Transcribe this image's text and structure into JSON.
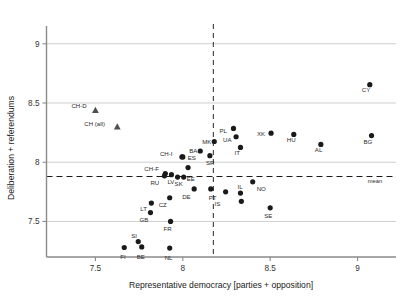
{
  "chart_data": {
    "type": "scatter",
    "title": "",
    "xlabel": "Representative democracy [parties + opposition]",
    "ylabel": "Deliberation + referendums",
    "xlim": [
      7.22,
      9.22
    ],
    "ylim": [
      7.2,
      9.15
    ],
    "xticks": [
      "7.5",
      "8",
      "8.5",
      "9"
    ],
    "xtick_values": [
      7.5,
      8.0,
      8.5,
      9.0
    ],
    "yticks": [
      "7.5",
      "8",
      "8.5",
      "9"
    ],
    "ytick_values": [
      7.5,
      8.0,
      8.5,
      9.0
    ],
    "grid": "horizontal",
    "legend": "none",
    "annotations": [
      {
        "text": "mean",
        "x": 9.1,
        "y": 7.88,
        "name": "mean-label"
      }
    ],
    "reference_lines": [
      {
        "orientation": "horizontal",
        "value": 7.88,
        "style": "dashed",
        "label": "mean"
      },
      {
        "orientation": "vertical",
        "value": 8.175,
        "style": "dashed",
        "label": ""
      }
    ],
    "series": [
      {
        "name": "countries",
        "marker": "circle",
        "points": [
          {
            "label": "CY",
            "x": 9.07,
            "y": 8.655,
            "lx": -8,
            "ly": 7
          },
          {
            "label": "BG",
            "x": 9.08,
            "y": 8.225,
            "lx": -8,
            "ly": 8
          },
          {
            "label": "AL",
            "x": 8.79,
            "y": 8.15,
            "lx": -6,
            "ly": 8
          },
          {
            "label": "HU",
            "x": 8.635,
            "y": 8.235,
            "lx": -7,
            "ly": 8
          },
          {
            "label": "XK",
            "x": 8.505,
            "y": 8.245,
            "lx": -14,
            "ly": 3
          },
          {
            "label": "PL",
            "x": 8.29,
            "y": 8.285,
            "lx": -14,
            "ly": 5
          },
          {
            "label": "UA",
            "x": 8.305,
            "y": 8.215,
            "lx": -13,
            "ly": 5
          },
          {
            "label": "IT",
            "x": 8.33,
            "y": 8.125,
            "lx": -6,
            "ly": 8
          },
          {
            "label": "MK",
            "x": 8.18,
            "y": 8.175,
            "lx": -12,
            "ly": 2
          },
          {
            "label": "BA",
            "x": 8.1,
            "y": 8.095,
            "lx": -11,
            "ly": 2
          },
          {
            "label": "SR",
            "x": 8.155,
            "y": 8.055,
            "lx": -4,
            "ly": 9
          },
          {
            "label": "ES",
            "x": 8.0,
            "y": 8.045,
            "lx": 5,
            "ly": 3
          },
          {
            "label": "CH-I",
            "x": 7.995,
            "y": 8.045,
            "lx": -22,
            "ly": -1
          },
          {
            "label": "SI2",
            "x": 8.03,
            "y": 7.955,
            "lx": 3,
            "ly": 3
          },
          {
            "label": "CH-F",
            "x": 7.9,
            "y": 7.905,
            "lx": -21,
            "ly": -2
          },
          {
            "label": "RU",
            "x": 7.895,
            "y": 7.885,
            "lx": -14,
            "ly": 9
          },
          {
            "label": "LV",
            "x": 7.935,
            "y": 7.895,
            "lx": -4,
            "ly": 9
          },
          {
            "label": "SK",
            "x": 7.97,
            "y": 7.875,
            "lx": -3,
            "ly": 9
          },
          {
            "label": "EE",
            "x": 8.005,
            "y": 7.875,
            "lx": 3,
            "ly": 4
          },
          {
            "label": "DE",
            "x": 8.065,
            "y": 7.775,
            "lx": -12,
            "ly": 10
          },
          {
            "label": "CZ",
            "x": 7.925,
            "y": 7.7,
            "lx": -11,
            "ly": 9
          },
          {
            "label": "LT",
            "x": 7.82,
            "y": 7.655,
            "lx": -11,
            "ly": 8
          },
          {
            "label": "GB",
            "x": 7.815,
            "y": 7.575,
            "lx": -11,
            "ly": 9
          },
          {
            "label": "FR",
            "x": 7.93,
            "y": 7.5,
            "lx": -7,
            "ly": 10
          },
          {
            "label": "SI",
            "x": 7.745,
            "y": 7.33,
            "lx": -7,
            "ly": -4
          },
          {
            "label": "FI",
            "x": 7.665,
            "y": 7.28,
            "lx": -4,
            "ly": 11
          },
          {
            "label": "BE",
            "x": 7.765,
            "y": 7.285,
            "lx": -5,
            "ly": 12
          },
          {
            "label": "NL",
            "x": 7.925,
            "y": 7.275,
            "lx": -5,
            "ly": 12
          },
          {
            "label": "PT",
            "x": 8.16,
            "y": 7.775,
            "lx": -2,
            "ly": 11
          },
          {
            "label": "IL",
            "x": 8.33,
            "y": 7.74,
            "lx": -3,
            "ly": -4
          },
          {
            "label": "IS",
            "x": 8.245,
            "y": 7.75,
            "lx": -11,
            "ly": 14
          },
          {
            "label": "NO",
            "x": 8.4,
            "y": 7.835,
            "lx": 4,
            "ly": 9
          },
          {
            "label": "SE",
            "x": 8.5,
            "y": 7.615,
            "lx": -6,
            "ly": 10
          },
          {
            "label": "HR",
            "x": 8.335,
            "y": 7.67,
            "lx": 0,
            "ly": 0
          }
        ]
      },
      {
        "name": "switzerland",
        "marker": "triangle",
        "points": [
          {
            "label": "CH-D",
            "x": 7.5,
            "y": 8.44,
            "lx": -24,
            "ly": -2
          },
          {
            "label": "CH (all)",
            "x": 7.625,
            "y": 8.3,
            "lx": -33,
            "ly": -1
          }
        ]
      }
    ]
  }
}
